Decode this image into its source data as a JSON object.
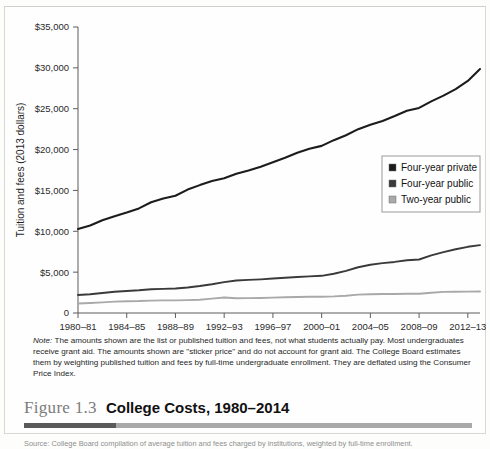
{
  "figure": {
    "number": "Figure 1.3",
    "title": "College Costs, 1980–2014",
    "note_prefix": "Note:",
    "note_body": " The amounts shown are the list or published tuition and fees, not what students actually pay. Most undergraduates receive grant aid. The amounts shown are \"sticker price\" and do not account for grant aid. The College Board estimates them by weighting published tuition and fees by full-time undergraduate enrollment. They are deflated using the Consumer Price Index.",
    "source": "Source: College Board compilation of average tuition and fees charged by institutions, weighted by full-time enrollment."
  },
  "colors": {
    "private": "#1c1c1c",
    "public4": "#3a3a3a",
    "public2": "#a9a9a9",
    "axis": "#5d5d5d",
    "rule_dark": "#5a5a5a",
    "rule_light": "#a8a8a8"
  },
  "chart_data": {
    "type": "line",
    "title": "College Costs, 1980–2014",
    "xlabel": "",
    "ylabel": "Tuition and fees (2013 dollars)",
    "ylim": [
      0,
      35000
    ],
    "yticks": [
      0,
      5000,
      10000,
      15000,
      20000,
      25000,
      30000,
      35000
    ],
    "ytick_labels": [
      "0",
      "$5,000",
      "$10,000",
      "$15,000",
      "$20,000",
      "$25,000",
      "$30,000",
      "$35,000"
    ],
    "grid": false,
    "legend_position": "center-right",
    "x": [
      "1980–81",
      "1981–82",
      "1982–83",
      "1983–84",
      "1984–85",
      "1985–86",
      "1986–87",
      "1987–88",
      "1988–89",
      "1989–90",
      "1990–91",
      "1991–92",
      "1992–93",
      "1993–94",
      "1994–95",
      "1995–96",
      "1996–97",
      "1997–98",
      "1998–99",
      "1999–2000",
      "2000–01",
      "2001–02",
      "2002–03",
      "2003–04",
      "2004–05",
      "2005–06",
      "2006–07",
      "2007–08",
      "2008–09",
      "2009–10",
      "2010–11",
      "2011–12",
      "2012–13",
      "2013–14"
    ],
    "xtick_labels": [
      "1980–81",
      "1984–85",
      "1988–89",
      "1992–93",
      "1996–97",
      "2000–01",
      "2004–05",
      "2008–09",
      "2012–13"
    ],
    "xtick_indices": [
      0,
      4,
      8,
      12,
      16,
      20,
      24,
      28,
      32
    ],
    "series": [
      {
        "name": "Four-year private",
        "color": "#1c1c1c",
        "width": 2.1,
        "values": [
          10280,
          10700,
          11350,
          11850,
          12300,
          12800,
          13550,
          14000,
          14350,
          15100,
          15650,
          16150,
          16500,
          17050,
          17450,
          17900,
          18450,
          19000,
          19600,
          20100,
          20450,
          21150,
          21750,
          22500,
          23050,
          23500,
          24100,
          24750,
          25100,
          25900,
          26600,
          27400,
          28400,
          29850
        ]
      },
      {
        "name": "Four-year public",
        "color": "#3a3a3a",
        "width": 1.9,
        "values": [
          2200,
          2300,
          2450,
          2600,
          2700,
          2780,
          2900,
          2950,
          3000,
          3120,
          3300,
          3520,
          3780,
          3980,
          4050,
          4120,
          4220,
          4320,
          4400,
          4480,
          4550,
          4800,
          5150,
          5600,
          5900,
          6100,
          6250,
          6450,
          6550,
          7050,
          7450,
          7800,
          8100,
          8300
        ]
      },
      {
        "name": "Two-year public",
        "color": "#a9a9a9",
        "width": 1.9,
        "values": [
          1170,
          1220,
          1300,
          1390,
          1440,
          1460,
          1520,
          1540,
          1550,
          1580,
          1620,
          1760,
          1900,
          1810,
          1820,
          1840,
          1880,
          1920,
          1960,
          1980,
          1990,
          2030,
          2120,
          2250,
          2300,
          2320,
          2330,
          2350,
          2360,
          2480,
          2580,
          2600,
          2620,
          2640
        ]
      }
    ]
  }
}
